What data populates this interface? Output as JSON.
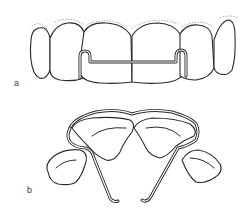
{
  "figure": {
    "panels": [
      {
        "id": "a",
        "label": "a",
        "description": "Anterior view of upper front teeth with bonded wire retainer on lingual side"
      },
      {
        "id": "b",
        "label": "b",
        "description": "Occlusal view of retainer wire with tooth outlines and wire tails"
      }
    ],
    "colors": {
      "line": "#2a2a2a",
      "background": "#ffffff",
      "stipple": "#888888",
      "label": "#444444"
    }
  }
}
